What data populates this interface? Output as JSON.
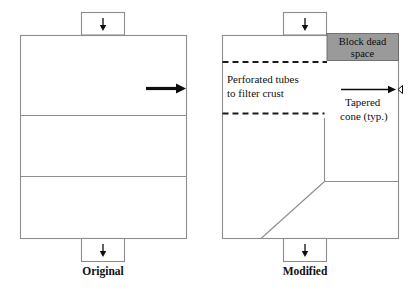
{
  "figure": {
    "title_present": false,
    "panels": [
      {
        "id": "original",
        "caption": "Original",
        "inlet_icon": "down-arrow-icon",
        "outlet_icon": "down-arrow-icon",
        "flow_icon": "right-arrow-icon",
        "compartments": 3,
        "annotations": []
      },
      {
        "id": "modified",
        "caption": "Modified",
        "inlet_icon": "down-arrow-icon",
        "outlet_icon": "down-arrow-icon",
        "flow_icon": "right-arrow-icon",
        "compartments": 3,
        "annotations": [
          {
            "id": "block-dead-space",
            "line1": "Block dead",
            "line2": "space",
            "fill_color": "#9a9a9a"
          },
          {
            "id": "perforated-tubes",
            "line1": "Perforated tubes",
            "line2": "to filter crust"
          },
          {
            "id": "tapered-cone",
            "line1": "Tapered",
            "line2": "cone (typ.)"
          }
        ]
      }
    ]
  },
  "colors": {
    "vessel_outline": "#8d8d8d",
    "dead_space_fill": "#9a9a9a",
    "dashed_line": "#1a1a1a",
    "arrow": "#0d0d0d",
    "background": "#ffffff"
  }
}
